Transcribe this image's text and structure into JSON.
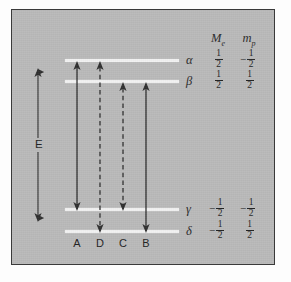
{
  "figure": {
    "kind": "energy-level-transition-diagram",
    "background_color": "#b9b9b9",
    "frame_color": "#3a3a3a",
    "level_line_color": "#f2f2f2",
    "arrow_color": "#2e2e2e"
  },
  "energy_axis": {
    "label": "E",
    "style": "double-headed-vertical-arrow"
  },
  "columns": {
    "headers": [
      {
        "id": "Me",
        "base": "M",
        "sub": "e"
      },
      {
        "id": "mp",
        "base": "m",
        "sub": "p"
      }
    ]
  },
  "levels": [
    {
      "label": "α",
      "name": "alpha",
      "Me": {
        "sign": "",
        "num": "1",
        "den": "2"
      },
      "mp": {
        "sign": "−",
        "num": "1",
        "den": "2"
      }
    },
    {
      "label": "β",
      "name": "beta",
      "Me": {
        "sign": "",
        "num": "1",
        "den": "2"
      },
      "mp": {
        "sign": "",
        "num": "1",
        "den": "2"
      }
    },
    {
      "label": "γ",
      "name": "gamma",
      "Me": {
        "sign": "−",
        "num": "1",
        "den": "2"
      },
      "mp": {
        "sign": "−",
        "num": "1",
        "den": "2"
      }
    },
    {
      "label": "δ",
      "name": "delta",
      "Me": {
        "sign": "−",
        "num": "1",
        "den": "2"
      },
      "mp": {
        "sign": "",
        "num": "1",
        "den": "2"
      }
    }
  ],
  "transitions": [
    {
      "label": "A",
      "from": "γ",
      "to": "α",
      "style": "solid"
    },
    {
      "label": "D",
      "from": "δ",
      "to": "α",
      "style": "dashed"
    },
    {
      "label": "C",
      "from": "γ",
      "to": "β",
      "style": "dashed"
    },
    {
      "label": "B",
      "from": "δ",
      "to": "β",
      "style": "solid"
    }
  ]
}
